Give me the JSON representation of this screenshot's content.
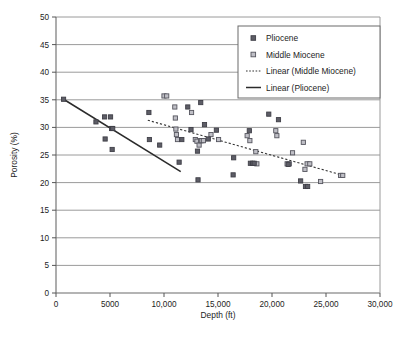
{
  "chart_data": {
    "type": "scatter",
    "title": "",
    "xlabel": "Depth (ft)",
    "ylabel": "Porosity (%)",
    "xlim": [
      0,
      30000
    ],
    "ylim": [
      0,
      50
    ],
    "xticks": [
      0,
      5000,
      10000,
      15000,
      20000,
      25000,
      30000
    ],
    "xtick_labels": [
      "0",
      "5000",
      "10,000",
      "15,000",
      "20,000",
      "25,000",
      "30,000"
    ],
    "yticks": [
      0,
      5,
      10,
      15,
      20,
      25,
      30,
      35,
      40,
      45,
      50
    ],
    "ytick_labels": [
      "0",
      "5",
      "10",
      "15",
      "20",
      "25",
      "30",
      "35",
      "40",
      "45",
      "50"
    ],
    "grid": "horizontal",
    "legend_position": "upper-right",
    "marker_colors": {
      "pliocene": "#5d5d66",
      "middle_miocene": "#8d8d97"
    },
    "line_colors": {
      "linear_pliocene": "#2b2b2b",
      "linear_middle_miocene": "#333333"
    },
    "series": [
      {
        "name": "Pliocene",
        "marker": "filled-square",
        "points": [
          [
            700,
            35.1
          ],
          [
            3700,
            31.0
          ],
          [
            4500,
            31.9
          ],
          [
            5050,
            31.9
          ],
          [
            5150,
            29.8
          ],
          [
            5250,
            29.8
          ],
          [
            4550,
            27.9
          ],
          [
            5200,
            26.0
          ],
          [
            8600,
            32.7
          ],
          [
            8650,
            27.8
          ],
          [
            9600,
            26.8
          ],
          [
            11400,
            23.7
          ],
          [
            11650,
            27.8
          ],
          [
            12200,
            33.7
          ],
          [
            12500,
            29.6
          ],
          [
            13100,
            25.7
          ],
          [
            13150,
            20.5
          ],
          [
            13400,
            34.5
          ],
          [
            13750,
            30.5
          ],
          [
            14100,
            27.9
          ],
          [
            14850,
            29.5
          ],
          [
            16400,
            21.4
          ],
          [
            16450,
            24.5
          ],
          [
            17900,
            29.4
          ],
          [
            18000,
            23.5
          ],
          [
            18200,
            23.5
          ],
          [
            18350,
            23.5
          ],
          [
            19700,
            32.4
          ],
          [
            20600,
            31.4
          ],
          [
            21500,
            23.3
          ],
          [
            22650,
            20.3
          ],
          [
            23100,
            19.3
          ],
          [
            23300,
            19.3
          ]
        ]
      },
      {
        "name": "Middle Miocene",
        "marker": "open-square",
        "points": [
          [
            10000,
            35.7
          ],
          [
            10250,
            35.7
          ],
          [
            11000,
            33.7
          ],
          [
            11050,
            31.7
          ],
          [
            11100,
            29.7
          ],
          [
            11150,
            28.7
          ],
          [
            11250,
            27.8
          ],
          [
            12550,
            32.7
          ],
          [
            12900,
            27.8
          ],
          [
            13050,
            27.5
          ],
          [
            13250,
            26.8
          ],
          [
            13400,
            27.6
          ],
          [
            13500,
            27.6
          ],
          [
            13650,
            27.6
          ],
          [
            14350,
            28.7
          ],
          [
            15050,
            27.8
          ],
          [
            17700,
            28.5
          ],
          [
            17950,
            27.6
          ],
          [
            18500,
            25.6
          ],
          [
            18600,
            23.4
          ],
          [
            20350,
            29.4
          ],
          [
            20450,
            28.5
          ],
          [
            21400,
            23.4
          ],
          [
            21600,
            23.4
          ],
          [
            21900,
            25.4
          ],
          [
            22900,
            27.3
          ],
          [
            23050,
            22.4
          ],
          [
            23250,
            23.4
          ],
          [
            23500,
            23.4
          ],
          [
            24500,
            20.2
          ],
          [
            26350,
            21.3
          ],
          [
            26550,
            21.3
          ]
        ]
      }
    ],
    "trendlines": [
      {
        "name": "Linear (Pliocene)",
        "style": "solid",
        "x": [
          700,
          11550
        ],
        "y": [
          35.1,
          22.0
        ]
      },
      {
        "name": "Linear (Middle Miocene)",
        "style": "dotted",
        "x": [
          8500,
          26600
        ],
        "y": [
          31.3,
          21.3
        ]
      }
    ],
    "legend_entries": [
      {
        "label": "Pliocene",
        "type": "marker",
        "marker": "filled-square"
      },
      {
        "label": "Middle Miocene",
        "type": "marker",
        "marker": "open-square"
      },
      {
        "label": "Linear (Middle Miocene)",
        "type": "line",
        "style": "dotted"
      },
      {
        "label": "Linear (Pliocene)",
        "type": "line",
        "style": "solid"
      }
    ]
  },
  "caption": {
    "text": ""
  }
}
